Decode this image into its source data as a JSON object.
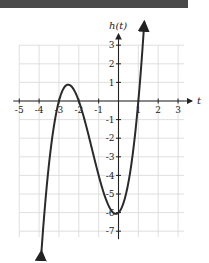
{
  "chart_data": {
    "type": "line",
    "title": "",
    "function": "h(t) = (t - 1)(t + 2)(t + 3)",
    "xlabel": "t",
    "ylabel": "h(t)",
    "xlim": [
      -5,
      3
    ],
    "ylim": [
      -7,
      3
    ],
    "grid": true,
    "x_ticks": [
      "-5",
      "-4",
      "-3",
      "-2",
      "-1",
      "1",
      "2",
      "3"
    ],
    "y_ticks": [
      "3",
      "2",
      "1",
      "-1",
      "-2",
      "-3",
      "-4",
      "-5",
      "-6",
      "-7"
    ],
    "key_points": [
      {
        "t": -3,
        "h": 0,
        "label": "zero"
      },
      {
        "t": -2.53,
        "h": 0.88,
        "label": "local max"
      },
      {
        "t": -2,
        "h": 0,
        "label": "zero"
      },
      {
        "t": 0,
        "h": -6,
        "label": "y-intercept"
      },
      {
        "t": 0.2,
        "h": -6.05,
        "label": "local min"
      },
      {
        "t": 1,
        "h": 0,
        "label": "zero"
      }
    ],
    "series": [
      {
        "name": "h(t)",
        "x": [
          -3.9,
          -3.5,
          -3,
          -2.75,
          -2.5,
          -2.25,
          -2,
          -1.5,
          -1,
          -0.5,
          0,
          0.25,
          0.5,
          0.75,
          1,
          1.25,
          1.4
        ],
        "values": [
          -7.6,
          -3.4,
          0,
          0.7,
          0.87,
          0.6,
          0,
          -1.88,
          -4,
          -5.63,
          -6,
          -5.77,
          -5.13,
          -3.52,
          0,
          2.98,
          5.03
        ]
      }
    ],
    "arrows": "both ends"
  },
  "axes": {
    "x_label": "t",
    "y_label": "h(t)"
  }
}
